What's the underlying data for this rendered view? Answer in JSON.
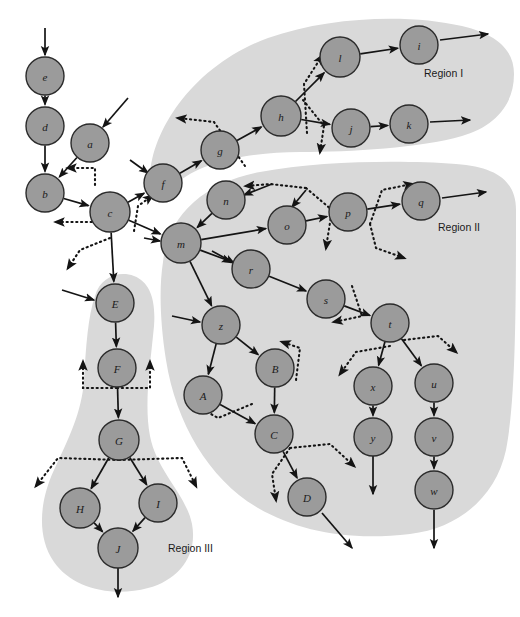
{
  "figure": {
    "background_color": "#ffffff",
    "node_fill": "#9b9b9b",
    "node_stroke": "#2b2b2b",
    "region_fill": "#d9d9d9",
    "edge_color": "#141414"
  },
  "regions": [
    {
      "id": "region-1",
      "label": "Region I",
      "label_x": 424,
      "label_y": 73,
      "path": "M 150 176 C 152 128 196 64 268 38 C 330 16 410 14 462 26 C 500 35 514 52 514 74 C 514 104 496 126 462 136 C 420 148 352 152 300 152 C 250 152 200 162 176 184 C 162 196 148 194 150 176 Z"
    },
    {
      "id": "region-2",
      "label": "Region II",
      "label_x": 438,
      "label_y": 227,
      "path": "M 163 262 C 168 214 206 182 260 172 C 320 161 400 160 456 164 C 498 167 516 182 516 210 C 516 300 516 400 506 450 C 496 496 460 528 410 534 C 350 541 300 532 258 508 C 210 480 176 424 166 360 C 160 322 159 288 163 262 Z"
    },
    {
      "id": "region-3",
      "label": "Region III",
      "label_x": 168,
      "label_y": 548,
      "path": "M 95 296 C 100 278 118 270 134 276 C 150 282 156 300 154 326 C 150 368 144 404 150 436 C 157 472 186 494 192 524 C 198 556 178 580 148 588 C 112 598 72 588 54 562 C 36 536 40 500 54 470 C 68 440 82 412 84 380 C 86 346 88 316 95 296 Z"
    }
  ],
  "nodes": [
    {
      "id": "e",
      "label": "e",
      "x": 45,
      "y": 76,
      "r": 19
    },
    {
      "id": "d",
      "label": "d",
      "x": 45,
      "y": 126,
      "r": 19
    },
    {
      "id": "a",
      "label": "a",
      "x": 90,
      "y": 143,
      "r": 19
    },
    {
      "id": "b",
      "label": "b",
      "x": 45,
      "y": 193,
      "r": 19
    },
    {
      "id": "c",
      "label": "c",
      "x": 110,
      "y": 212,
      "r": 20
    },
    {
      "id": "f",
      "label": "f",
      "x": 163,
      "y": 183,
      "r": 19
    },
    {
      "id": "g",
      "label": "g",
      "x": 220,
      "y": 150,
      "r": 19
    },
    {
      "id": "h",
      "label": "h",
      "x": 281,
      "y": 116,
      "r": 20
    },
    {
      "id": "l",
      "label": "l",
      "x": 340,
      "y": 57,
      "r": 20
    },
    {
      "id": "i",
      "label": "i",
      "x": 419,
      "y": 45,
      "r": 19
    },
    {
      "id": "j",
      "label": "j",
      "x": 351,
      "y": 128,
      "r": 19
    },
    {
      "id": "k",
      "label": "k",
      "x": 409,
      "y": 124,
      "r": 19
    },
    {
      "id": "n",
      "label": "n",
      "x": 226,
      "y": 200,
      "r": 19
    },
    {
      "id": "o",
      "label": "o",
      "x": 287,
      "y": 225,
      "r": 19
    },
    {
      "id": "p",
      "label": "p",
      "x": 348,
      "y": 212,
      "r": 19
    },
    {
      "id": "q",
      "label": "q",
      "x": 421,
      "y": 201,
      "r": 19
    },
    {
      "id": "m",
      "label": "m",
      "x": 181,
      "y": 243,
      "r": 20
    },
    {
      "id": "r",
      "label": "r",
      "x": 251,
      "y": 269,
      "r": 19
    },
    {
      "id": "s",
      "label": "s",
      "x": 326,
      "y": 299,
      "r": 19
    },
    {
      "id": "t",
      "label": "t",
      "x": 390,
      "y": 323,
      "r": 19
    },
    {
      "id": "z",
      "label": "z",
      "x": 221,
      "y": 325,
      "r": 19
    },
    {
      "id": "B",
      "label": "B",
      "x": 275,
      "y": 368,
      "r": 19
    },
    {
      "id": "A",
      "label": "A",
      "x": 203,
      "y": 395,
      "r": 19
    },
    {
      "id": "C",
      "label": "C",
      "x": 274,
      "y": 434,
      "r": 19
    },
    {
      "id": "D",
      "label": "D",
      "x": 307,
      "y": 497,
      "r": 19
    },
    {
      "id": "x",
      "label": "x",
      "x": 373,
      "y": 386,
      "r": 19
    },
    {
      "id": "u",
      "label": "u",
      "x": 434,
      "y": 383,
      "r": 19
    },
    {
      "id": "y",
      "label": "y",
      "x": 373,
      "y": 437,
      "r": 19
    },
    {
      "id": "v",
      "label": "v",
      "x": 434,
      "y": 437,
      "r": 19
    },
    {
      "id": "w",
      "label": "w",
      "x": 434,
      "y": 490,
      "r": 19
    },
    {
      "id": "E",
      "label": "E",
      "x": 115,
      "y": 303,
      "r": 19
    },
    {
      "id": "F",
      "label": "F",
      "x": 117,
      "y": 368,
      "r": 19
    },
    {
      "id": "G",
      "label": "G",
      "x": 119,
      "y": 440,
      "r": 20
    },
    {
      "id": "H",
      "label": "H",
      "x": 80,
      "y": 508,
      "r": 20
    },
    {
      "id": "I",
      "label": "I",
      "x": 158,
      "y": 503,
      "r": 19
    },
    {
      "id": "J",
      "label": "J",
      "x": 118,
      "y": 548,
      "r": 20
    }
  ],
  "solid_edges": [
    {
      "from": "e",
      "to": "d"
    },
    {
      "from": "d",
      "to": "b"
    },
    {
      "from": "a",
      "to": "b"
    },
    {
      "from": "b",
      "to": "c"
    },
    {
      "from": "c",
      "to": "f"
    },
    {
      "from": "c",
      "to": "m"
    },
    {
      "from": "c",
      "to": "E"
    },
    {
      "from": "f",
      "to": "g"
    },
    {
      "from": "g",
      "to": "h"
    },
    {
      "from": "h",
      "to": "l"
    },
    {
      "from": "h",
      "to": "j"
    },
    {
      "from": "l",
      "to": "i"
    },
    {
      "from": "j",
      "to": "k"
    },
    {
      "from": "n",
      "to": "m"
    },
    {
      "from": "m",
      "to": "o"
    },
    {
      "from": "m",
      "to": "r"
    },
    {
      "from": "m",
      "to": "z"
    },
    {
      "from": "o",
      "to": "p"
    },
    {
      "from": "p",
      "to": "q"
    },
    {
      "from": "r",
      "to": "s"
    },
    {
      "from": "s",
      "to": "t"
    },
    {
      "from": "t",
      "to": "x"
    },
    {
      "from": "t",
      "to": "u"
    },
    {
      "from": "x",
      "to": "y"
    },
    {
      "from": "u",
      "to": "v"
    },
    {
      "from": "v",
      "to": "w"
    },
    {
      "from": "z",
      "to": "A"
    },
    {
      "from": "z",
      "to": "B"
    },
    {
      "from": "A",
      "to": "C"
    },
    {
      "from": "B",
      "to": "C"
    },
    {
      "from": "C",
      "to": "D"
    },
    {
      "from": "E",
      "to": "F"
    },
    {
      "from": "F",
      "to": "G"
    },
    {
      "from": "G",
      "to": "H"
    },
    {
      "from": "G",
      "to": "I"
    },
    {
      "from": "H",
      "to": "J"
    },
    {
      "from": "I",
      "to": "J"
    }
  ],
  "external_in_arrows": [
    {
      "target": "e",
      "path": "M 45 28 L 45 55"
    },
    {
      "target": "a",
      "path": "M 128 98 L 103 127"
    },
    {
      "target": "f",
      "path": "M 130 160 L 148 173"
    },
    {
      "target": "n",
      "path": "M 272 184 L 244 195"
    },
    {
      "target": "o",
      "path": "M 306 190 L 292 207"
    },
    {
      "target": "m",
      "path": "M 144 238 L 160 241"
    },
    {
      "target": "r",
      "path": "M 212 251 L 234 263"
    },
    {
      "target": "z",
      "path": "M 172 316 L 200 322"
    },
    {
      "target": "E",
      "path": "M 62 290 L 94 300"
    }
  ],
  "external_out_arrows": [
    {
      "source": "i",
      "path": "M 440 40 L 488 34"
    },
    {
      "source": "k",
      "path": "M 430 122 L 470 120"
    },
    {
      "source": "q",
      "path": "M 442 198 L 486 192"
    },
    {
      "source": "y",
      "path": "M 373 456 L 373 494"
    },
    {
      "source": "w",
      "path": "M 434 510 L 434 548"
    },
    {
      "source": "D",
      "path": "M 322 513 L 352 548"
    },
    {
      "source": "J",
      "path": "M 118 568 L 118 597"
    }
  ],
  "dotted_edges": [
    {
      "id": "dotted-a-b-return",
      "path": "M 95 185 L 95 168 L 68 168"
    },
    {
      "id": "dotted-b-down",
      "path": "M 94 205 L 94 222 L 56 222"
    },
    {
      "id": "dotted-c-down",
      "path": "M 110 238 L 80 250 L 68 268"
    },
    {
      "id": "dotted-c-f-right",
      "path": "M 134 231 L 138 206 L 152 196"
    },
    {
      "id": "dotted-g-left",
      "path": "M 245 166 L 214 122 L 178 118"
    },
    {
      "id": "dotted-h-up",
      "path": "M 307 133 L 304 84 L 322 56"
    },
    {
      "id": "dotted-h-down",
      "path": "M 303 100 L 324 126 L 320 152"
    },
    {
      "id": "dotted-n-left",
      "path": "M 306 188 L 270 184 L 246 186"
    },
    {
      "id": "dotted-o-down",
      "path": "M 306 188 L 332 210 L 326 248"
    },
    {
      "id": "dotted-p-q-up",
      "path": "M 370 224 L 382 190 L 412 184"
    },
    {
      "id": "dotted-p-q-down",
      "path": "M 370 224 L 376 248 L 404 258"
    },
    {
      "id": "dotted-s-left",
      "path": "M 352 286 L 362 316 L 334 322"
    },
    {
      "id": "dotted-t-left",
      "path": "M 390 346 L 356 352 L 340 374"
    },
    {
      "id": "dotted-t-right",
      "path": "M 404 340 L 438 336 L 456 352"
    },
    {
      "id": "dotted-B-up",
      "path": "M 296 380 L 300 348 L 282 342"
    },
    {
      "id": "dotted-A-left",
      "path": "M 252 404 L 218 418 L 190 402"
    },
    {
      "id": "dotted-C-right",
      "path": "M 290 448 L 330 444 L 354 466"
    },
    {
      "id": "dotted-C-down",
      "path": "M 290 448 L 272 474 L 276 500"
    },
    {
      "id": "dotted-F-left",
      "path": "M 117 388 L 83 388 L 83 362"
    },
    {
      "id": "dotted-F-right",
      "path": "M 117 388 L 150 388 L 150 362"
    },
    {
      "id": "dotted-G-left",
      "path": "M 119 460 L 58 458 L 36 486"
    },
    {
      "id": "dotted-G-right",
      "path": "M 119 460 L 182 458 L 196 486"
    }
  ]
}
